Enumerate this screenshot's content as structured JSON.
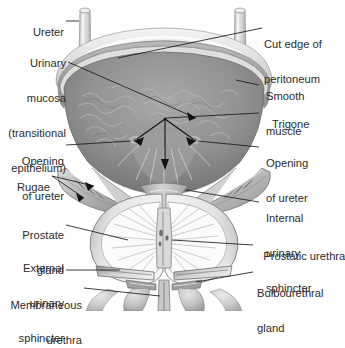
{
  "figure": {
    "view": "anterior frontal section",
    "style": "grayscale medical illustration",
    "palette": {
      "background": "#ffffff",
      "label_text": "#2b2b2b",
      "leader_line": "#1a1a1a",
      "peritoneum_light": "#e8e8e8",
      "peritoneum_mid": "#c9c9c9",
      "smooth_muscle": "#a8a8a8",
      "mucosa_dark": "#8d8d8d",
      "cavity_shadow": "#7c7c7c",
      "prostate_light": "#f2f2f2",
      "prostate_mid": "#cfcfcf",
      "outline": "#6e6e6e",
      "ureter_tube": "#dcdcdc"
    }
  },
  "labels_left": [
    {
      "id": "ureter",
      "text": "Ureter",
      "lines": [
        "Ureter"
      ]
    },
    {
      "id": "urinary-mucosa",
      "text": "Urinary mucosa (transitional epithelium)",
      "lines": [
        "Urinary",
        "mucosa",
        "(transitional",
        "epithelium)"
      ]
    },
    {
      "id": "opening-of-ureter-l",
      "text": "Opening of ureter",
      "lines": [
        "Opening",
        "of ureter"
      ]
    },
    {
      "id": "rugae",
      "text": "Rugae",
      "lines": [
        "Rugae"
      ]
    },
    {
      "id": "prostate-gland",
      "text": "Prostate gland",
      "lines": [
        "Prostate",
        "gland"
      ]
    },
    {
      "id": "external-urinary-sphincter",
      "text": "External urinary sphincter",
      "lines": [
        "External",
        "urinary",
        "sphincter"
      ]
    },
    {
      "id": "membraneous-urethra",
      "text": "Membraneous urethra",
      "lines": [
        "Membraneous",
        "urethra"
      ]
    }
  ],
  "labels_right": [
    {
      "id": "cut-edge-of-peritoneum",
      "text": "Cut edge of peritoneum",
      "lines": [
        "Cut edge of",
        "peritoneum"
      ]
    },
    {
      "id": "smooth-muscle",
      "text": "Smooth muscle",
      "lines": [
        "Smooth",
        "muscle"
      ]
    },
    {
      "id": "trigone",
      "text": "Trigone",
      "lines": [
        "Trigone"
      ]
    },
    {
      "id": "opening-of-ureter-r",
      "text": "Opening of ureter",
      "lines": [
        "Opening",
        "of ureter"
      ]
    },
    {
      "id": "internal-urinary-sphincter",
      "text": "Internal urinary sphincter",
      "lines": [
        "Internal",
        "urinary",
        "sphincter"
      ]
    },
    {
      "id": "prostatic-urethra",
      "text": "Prostatic urethra",
      "lines": [
        "Prostatic urethra"
      ]
    },
    {
      "id": "bulbourethral-gland",
      "text": "Bulbourethral gland",
      "lines": [
        "Bulbourethral",
        "gland"
      ]
    }
  ],
  "text": {
    "ureter_l1": "Ureter",
    "mucosa_l1": "Urinary",
    "mucosa_l2": "mucosa",
    "mucosa_l3": "(transitional",
    "mucosa_l4": "epithelium)",
    "openl_l1": "Opening",
    "openl_l2": "of ureter",
    "rugae_l1": "Rugae",
    "prostate_l1": "Prostate",
    "prostate_l2": "gland",
    "extsph_l1": "External",
    "extsph_l2": "urinary",
    "extsph_l3": "sphincter",
    "memb_l1": "Membraneous",
    "memb_l2": "urethra",
    "peri_l1": "Cut edge of",
    "peri_l2": "peritoneum",
    "smooth_l1": "Smooth",
    "smooth_l2": "muscle",
    "trigone_l1": "Trigone",
    "openr_l1": "Opening",
    "openr_l2": "of ureter",
    "intsph_l1": "Internal",
    "intsph_l2": "urinary",
    "intsph_l3": "sphincter",
    "prosureth_l1": "Prostatic urethra",
    "bulbo_l1": "Bulbourethral",
    "bulbo_l2": "gland"
  }
}
